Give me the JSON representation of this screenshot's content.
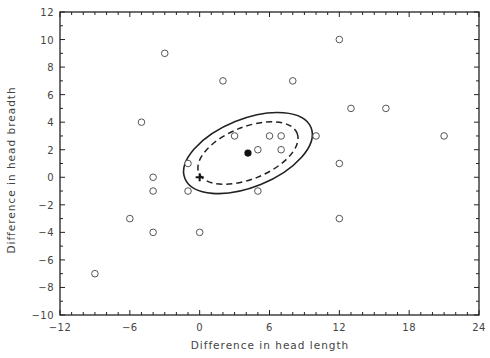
{
  "chart_data": {
    "type": "scatter",
    "title": "",
    "xlabel": "Difference in head length",
    "ylabel": "Difference in head breadth",
    "xlim": [
      -12,
      24
    ],
    "ylim": [
      -10,
      12
    ],
    "xticks": [
      -12,
      -6,
      0,
      6,
      12,
      18,
      24
    ],
    "xtick_labels": [
      "−12",
      "−6",
      "0",
      "6",
      "12",
      "18",
      "24"
    ],
    "yticks": [
      -10,
      -8,
      -6,
      -4,
      -2,
      0,
      2,
      4,
      6,
      8,
      10,
      12
    ],
    "ytick_labels": [
      "−10",
      "−8",
      "−6",
      "−4",
      "−2",
      "0",
      "2",
      "4",
      "6",
      "8",
      "10",
      "12"
    ],
    "grid": false,
    "legend": null,
    "series": [
      {
        "name": "observations",
        "marker": "open-circle",
        "points": [
          [
            -3,
            9
          ],
          [
            2,
            7
          ],
          [
            8,
            7
          ],
          [
            12,
            10
          ],
          [
            -5,
            4
          ],
          [
            13,
            5
          ],
          [
            16,
            5
          ],
          [
            3,
            3
          ],
          [
            6,
            3
          ],
          [
            7,
            3
          ],
          [
            10,
            3
          ],
          [
            21,
            3
          ],
          [
            5,
            2
          ],
          [
            7,
            2
          ],
          [
            -1,
            1
          ],
          [
            12,
            1
          ],
          [
            -4,
            0
          ],
          [
            -4,
            -1
          ],
          [
            -1,
            -1
          ],
          [
            5,
            -1
          ],
          [
            -6,
            -3
          ],
          [
            12,
            -3
          ],
          [
            -4,
            -4
          ],
          [
            0,
            -4
          ],
          [
            -9,
            -7
          ]
        ]
      },
      {
        "name": "sample-mean",
        "marker": "filled-circle",
        "points": [
          [
            4.15,
            1.76
          ]
        ]
      },
      {
        "name": "hypothesized-origin",
        "marker": "plus",
        "points": [
          [
            0,
            0
          ]
        ]
      }
    ],
    "annotations": [
      {
        "type": "ellipse",
        "style": "solid",
        "center": [
          4.15,
          1.76
        ],
        "description": "outer confidence region"
      },
      {
        "type": "ellipse",
        "style": "dashed",
        "center": [
          4.15,
          1.76
        ],
        "description": "inner confidence region"
      }
    ]
  },
  "plot": {
    "px_left": 60,
    "px_right": 479,
    "px_top": 12,
    "px_bottom": 315,
    "ellipse_rotation_deg": -22,
    "solid_ellipse_px": {
      "rx": 68,
      "ry": 34
    },
    "dashed_ellipse_px": {
      "rx": 53,
      "ry": 26
    },
    "colors": {
      "axis": "#222222",
      "marker": "#555555",
      "curve": "#222222",
      "text": "#444444"
    }
  }
}
